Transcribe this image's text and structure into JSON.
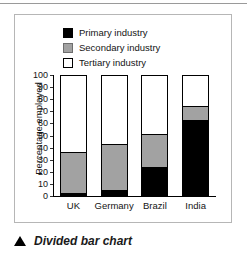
{
  "figure": {
    "caption": "Divided bar chart",
    "caption_marker_icon": "triangle-up-icon"
  },
  "chart_data": {
    "type": "bar",
    "stacked": true,
    "title": "",
    "xlabel": "",
    "ylabel": "Percentage employed",
    "ylim": [
      0,
      100
    ],
    "ytick_step": 10,
    "yticks": [
      100,
      90,
      80,
      70,
      60,
      50,
      40,
      30,
      20,
      10,
      0
    ],
    "grid": false,
    "legend_position": "top",
    "categories": [
      "UK",
      "Germany",
      "Brazil",
      "India"
    ],
    "series": [
      {
        "name": "Primary industry",
        "color": "#000000",
        "values": [
          2,
          4,
          23,
          62
        ]
      },
      {
        "name": "Secondary industry",
        "color": "#a2a2a2",
        "values": [
          33,
          37,
          27,
          11
        ]
      },
      {
        "name": "Tertiary industry",
        "color": "#ffffff",
        "values": [
          65,
          59,
          50,
          27
        ]
      }
    ],
    "cumulative_tops": {
      "primary": [
        2,
        4,
        23,
        62
      ],
      "secondary": [
        35,
        41,
        50,
        73
      ],
      "tertiary": [
        100,
        100,
        100,
        100
      ]
    }
  }
}
